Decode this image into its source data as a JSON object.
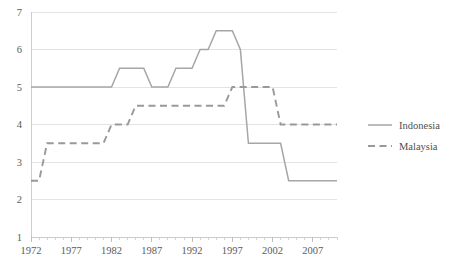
{
  "chart_data": {
    "type": "line",
    "title": "",
    "subtitle": "",
    "xlabel": "",
    "ylabel": "",
    "xlim": [
      1972,
      2010
    ],
    "ylim": [
      1,
      7
    ],
    "yticks": [
      1,
      2,
      3,
      4,
      5,
      6,
      7
    ],
    "ytick_labels": [
      "1",
      "2",
      "3",
      "4",
      "5",
      "6",
      "7"
    ],
    "xticks": [
      1972,
      1977,
      1982,
      1987,
      1992,
      1997,
      2002,
      2007
    ],
    "xtick_labels": [
      "1972",
      "1977",
      "1982",
      "1987",
      "1992",
      "1997",
      "2002",
      "2007"
    ],
    "minor_xtick_interval": 1,
    "grid": "horizontal",
    "legend_position": "right",
    "series": [
      {
        "name": "Indonesia",
        "style": "solid",
        "color": "#a6a6a6",
        "x": [
          1972,
          1973,
          1974,
          1975,
          1976,
          1977,
          1978,
          1979,
          1980,
          1981,
          1982,
          1983,
          1984,
          1985,
          1986,
          1987,
          1988,
          1989,
          1990,
          1991,
          1992,
          1993,
          1994,
          1995,
          1996,
          1997,
          1998,
          1999,
          2000,
          2001,
          2002,
          2003,
          2004,
          2005,
          2006,
          2007,
          2008,
          2009,
          2010
        ],
        "values": [
          5,
          5,
          5,
          5,
          5,
          5,
          5,
          5,
          5,
          5,
          5,
          5.5,
          5.5,
          5.5,
          5.5,
          5,
          5,
          5,
          5.5,
          5.5,
          5.5,
          6,
          6,
          6.5,
          6.5,
          6.5,
          6,
          3.5,
          3.5,
          3.5,
          3.5,
          3.5,
          2.5,
          2.5,
          2.5,
          2.5,
          2.5,
          2.5,
          2.5
        ]
      },
      {
        "name": "Malaysia",
        "style": "dashed",
        "color": "#999999",
        "x": [
          1972,
          1973,
          1974,
          1975,
          1976,
          1977,
          1978,
          1979,
          1980,
          1981,
          1982,
          1983,
          1984,
          1985,
          1986,
          1987,
          1988,
          1989,
          1990,
          1991,
          1992,
          1993,
          1994,
          1995,
          1996,
          1997,
          1998,
          1999,
          2000,
          2001,
          2002,
          2003,
          2004,
          2005,
          2006,
          2007,
          2008,
          2009,
          2010
        ],
        "values": [
          2.5,
          2.5,
          3.5,
          3.5,
          3.5,
          3.5,
          3.5,
          3.5,
          3.5,
          3.5,
          4,
          4,
          4,
          4.5,
          4.5,
          4.5,
          4.5,
          4.5,
          4.5,
          4.5,
          4.5,
          4.5,
          4.5,
          4.5,
          4.5,
          5,
          5,
          5,
          5,
          5,
          5,
          4,
          4,
          4,
          4,
          4,
          4,
          4,
          4
        ]
      }
    ]
  },
  "legend": {
    "items": [
      {
        "label": "Indonesia",
        "style": "solid",
        "color": "#a6a6a6"
      },
      {
        "label": "Malaysia",
        "style": "dashed",
        "color": "#999999"
      }
    ]
  }
}
